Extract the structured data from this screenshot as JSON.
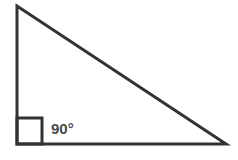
{
  "diagram": {
    "type": "right-triangle",
    "vertices": {
      "top": [
        17,
        6
      ],
      "bottom_left": [
        17,
        144
      ],
      "bottom_right": [
        226,
        144
      ]
    },
    "right_angle_marker": {
      "x": 17,
      "y": 118,
      "size": 25
    },
    "angle_label": "90°",
    "stroke_color": "#333333",
    "label_color": "#4a4a4a"
  }
}
